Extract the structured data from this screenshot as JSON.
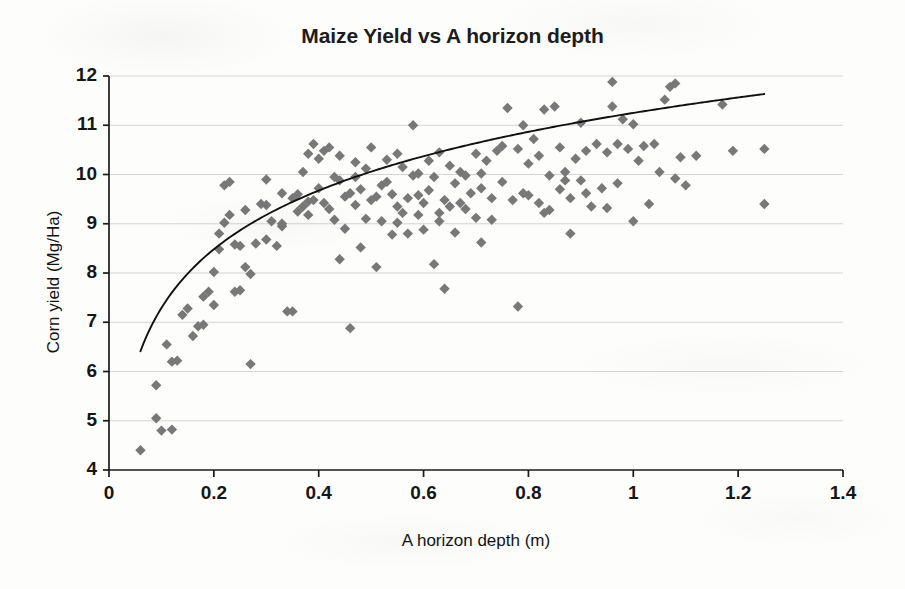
{
  "chart_data": {
    "type": "scatter",
    "title": "Maize Yield vs A horizon depth",
    "xlabel": "A horizon depth (m)",
    "ylabel": "Corn yield (Mg/Ha)",
    "xlim": [
      0,
      1.4
    ],
    "ylim": [
      4,
      12
    ],
    "xticks": [
      "0",
      "0.2",
      "0.4",
      "0.6",
      "0.8",
      "1",
      "1.2",
      "1.4"
    ],
    "xtick_values": [
      0,
      0.2,
      0.4,
      0.6,
      0.8,
      1,
      1.2,
      1.4
    ],
    "yticks": [
      "4",
      "5",
      "6",
      "7",
      "8",
      "9",
      "10",
      "11",
      "12"
    ],
    "ytick_values": [
      4,
      5,
      6,
      7,
      8,
      9,
      10,
      11,
      12
    ],
    "grid": "horizontal",
    "legend": "none",
    "marker": {
      "shape": "diamond",
      "color": "#787878",
      "size": 9
    },
    "series": [
      {
        "name": "Corn yield observations",
        "points": [
          [
            0.06,
            4.4
          ],
          [
            0.09,
            5.05
          ],
          [
            0.1,
            4.8
          ],
          [
            0.12,
            4.82
          ],
          [
            0.09,
            5.72
          ],
          [
            0.12,
            6.2
          ],
          [
            0.13,
            6.22
          ],
          [
            0.11,
            6.55
          ],
          [
            0.14,
            7.15
          ],
          [
            0.15,
            7.28
          ],
          [
            0.16,
            6.72
          ],
          [
            0.17,
            6.92
          ],
          [
            0.18,
            6.95
          ],
          [
            0.18,
            7.52
          ],
          [
            0.19,
            7.62
          ],
          [
            0.2,
            8.02
          ],
          [
            0.2,
            7.35
          ],
          [
            0.21,
            8.48
          ],
          [
            0.21,
            8.8
          ],
          [
            0.22,
            9.02
          ],
          [
            0.22,
            9.78
          ],
          [
            0.23,
            9.85
          ],
          [
            0.23,
            9.18
          ],
          [
            0.24,
            8.58
          ],
          [
            0.24,
            7.62
          ],
          [
            0.25,
            7.65
          ],
          [
            0.25,
            8.55
          ],
          [
            0.26,
            9.28
          ],
          [
            0.26,
            8.12
          ],
          [
            0.27,
            6.15
          ],
          [
            0.27,
            7.98
          ],
          [
            0.28,
            8.6
          ],
          [
            0.29,
            9.4
          ],
          [
            0.3,
            9.38
          ],
          [
            0.3,
            8.68
          ],
          [
            0.31,
            9.05
          ],
          [
            0.32,
            8.55
          ],
          [
            0.33,
            9.0
          ],
          [
            0.33,
            8.95
          ],
          [
            0.34,
            7.22
          ],
          [
            0.35,
            7.22
          ],
          [
            0.35,
            9.52
          ],
          [
            0.36,
            9.25
          ],
          [
            0.36,
            9.6
          ],
          [
            0.37,
            9.35
          ],
          [
            0.37,
            10.05
          ],
          [
            0.38,
            10.42
          ],
          [
            0.38,
            9.18
          ],
          [
            0.38,
            9.45
          ],
          [
            0.39,
            9.48
          ],
          [
            0.39,
            10.62
          ],
          [
            0.4,
            10.32
          ],
          [
            0.4,
            9.72
          ],
          [
            0.41,
            9.42
          ],
          [
            0.41,
            10.48
          ],
          [
            0.42,
            10.55
          ],
          [
            0.42,
            9.3
          ],
          [
            0.43,
            9.08
          ],
          [
            0.43,
            9.95
          ],
          [
            0.44,
            10.38
          ],
          [
            0.44,
            8.28
          ],
          [
            0.45,
            9.55
          ],
          [
            0.45,
            8.9
          ],
          [
            0.46,
            6.88
          ],
          [
            0.46,
            9.62
          ],
          [
            0.47,
            9.38
          ],
          [
            0.47,
            10.25
          ],
          [
            0.48,
            9.7
          ],
          [
            0.48,
            8.52
          ],
          [
            0.49,
            9.1
          ],
          [
            0.49,
            10.12
          ],
          [
            0.5,
            9.48
          ],
          [
            0.5,
            10.55
          ],
          [
            0.51,
            8.12
          ],
          [
            0.52,
            9.78
          ],
          [
            0.52,
            9.05
          ],
          [
            0.53,
            9.85
          ],
          [
            0.53,
            10.3
          ],
          [
            0.54,
            8.78
          ],
          [
            0.54,
            9.6
          ],
          [
            0.55,
            9.35
          ],
          [
            0.55,
            10.42
          ],
          [
            0.56,
            9.22
          ],
          [
            0.56,
            10.15
          ],
          [
            0.57,
            9.52
          ],
          [
            0.57,
            8.8
          ],
          [
            0.58,
            9.98
          ],
          [
            0.58,
            11.0
          ],
          [
            0.59,
            9.18
          ],
          [
            0.59,
            10.02
          ],
          [
            0.6,
            9.42
          ],
          [
            0.6,
            8.88
          ],
          [
            0.61,
            9.68
          ],
          [
            0.61,
            10.28
          ],
          [
            0.62,
            9.95
          ],
          [
            0.62,
            8.18
          ],
          [
            0.63,
            9.22
          ],
          [
            0.63,
            10.45
          ],
          [
            0.64,
            9.48
          ],
          [
            0.64,
            7.68
          ],
          [
            0.65,
            9.35
          ],
          [
            0.65,
            10.18
          ],
          [
            0.66,
            8.82
          ],
          [
            0.66,
            9.82
          ],
          [
            0.67,
            10.05
          ],
          [
            0.68,
            9.3
          ],
          [
            0.68,
            9.98
          ],
          [
            0.69,
            9.62
          ],
          [
            0.7,
            10.42
          ],
          [
            0.7,
            9.12
          ],
          [
            0.71,
            9.72
          ],
          [
            0.71,
            8.62
          ],
          [
            0.72,
            10.28
          ],
          [
            0.73,
            9.52
          ],
          [
            0.74,
            10.48
          ],
          [
            0.75,
            9.85
          ],
          [
            0.75,
            10.58
          ],
          [
            0.76,
            11.35
          ],
          [
            0.77,
            9.48
          ],
          [
            0.78,
            7.32
          ],
          [
            0.78,
            10.52
          ],
          [
            0.79,
            11.0
          ],
          [
            0.8,
            10.22
          ],
          [
            0.8,
            9.58
          ],
          [
            0.81,
            10.72
          ],
          [
            0.82,
            9.42
          ],
          [
            0.82,
            10.38
          ],
          [
            0.83,
            11.32
          ],
          [
            0.84,
            9.98
          ],
          [
            0.84,
            9.28
          ],
          [
            0.85,
            11.38
          ],
          [
            0.86,
            10.55
          ],
          [
            0.86,
            9.7
          ],
          [
            0.87,
            10.05
          ],
          [
            0.88,
            8.8
          ],
          [
            0.88,
            9.52
          ],
          [
            0.89,
            10.32
          ],
          [
            0.9,
            11.05
          ],
          [
            0.9,
            9.88
          ],
          [
            0.91,
            10.48
          ],
          [
            0.92,
            9.35
          ],
          [
            0.93,
            10.62
          ],
          [
            0.94,
            9.72
          ],
          [
            0.95,
            10.45
          ],
          [
            0.96,
            11.88
          ],
          [
            0.96,
            11.38
          ],
          [
            0.97,
            10.62
          ],
          [
            0.97,
            9.82
          ],
          [
            0.98,
            11.12
          ],
          [
            0.99,
            10.52
          ],
          [
            1.0,
            11.02
          ],
          [
            1.0,
            9.05
          ],
          [
            1.01,
            10.28
          ],
          [
            1.02,
            10.58
          ],
          [
            1.03,
            9.4
          ],
          [
            1.04,
            10.62
          ],
          [
            1.05,
            10.05
          ],
          [
            1.06,
            11.52
          ],
          [
            1.07,
            11.78
          ],
          [
            1.08,
            11.85
          ],
          [
            1.08,
            9.92
          ],
          [
            1.09,
            10.35
          ],
          [
            1.1,
            9.78
          ],
          [
            1.12,
            10.38
          ],
          [
            1.17,
            11.42
          ],
          [
            1.19,
            10.48
          ],
          [
            1.25,
            10.52
          ],
          [
            1.25,
            9.4
          ],
          [
            0.3,
            9.9
          ],
          [
            0.33,
            9.62
          ],
          [
            0.44,
            9.88
          ],
          [
            0.47,
            9.95
          ],
          [
            0.51,
            9.55
          ],
          [
            0.55,
            9.02
          ],
          [
            0.59,
            9.58
          ],
          [
            0.63,
            9.05
          ],
          [
            0.67,
            9.42
          ],
          [
            0.71,
            10.02
          ],
          [
            0.73,
            9.08
          ],
          [
            0.79,
            9.62
          ],
          [
            0.83,
            9.22
          ],
          [
            0.87,
            9.88
          ],
          [
            0.91,
            9.62
          ],
          [
            0.95,
            9.32
          ]
        ]
      }
    ],
    "trendline": {
      "type": "logarithmic",
      "equation_form": "y = a*ln(x) + b",
      "a": 1.72,
      "b": 11.25,
      "x_start": 0.06,
      "x_end": 1.25,
      "color": "#111111",
      "y_at_x_start": 5.8,
      "y_at_x_end": 10.87
    }
  }
}
